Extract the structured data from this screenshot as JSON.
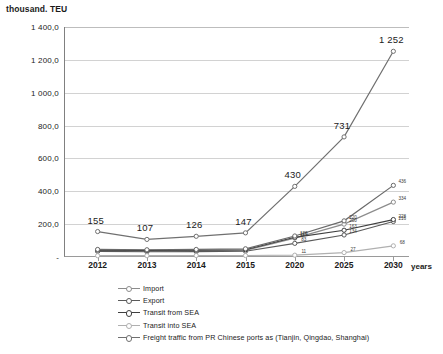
{
  "axes": {
    "y_title": "thousand. TEU",
    "x_title": "years",
    "y_ticks": [
      "1 400,0",
      "1 200,0",
      "1 000,0",
      "800,0",
      "600,0",
      "400,0",
      "200,0",
      "-"
    ],
    "x_ticks": [
      "2012",
      "2013",
      "2014",
      "2015",
      "2020",
      "2025",
      "2030"
    ]
  },
  "legend": {
    "items": [
      {
        "label": "Import",
        "color": "#8c8c8c"
      },
      {
        "label": "Export",
        "color": "#5a5a5a"
      },
      {
        "label": "Transit from SEA",
        "color": "#3f3f3f"
      },
      {
        "label": "Transit into SEA",
        "color": "#b0b0b0"
      },
      {
        "label": "Freight traffic from PR Chinese ports as (Tianjin, Qingdao, Shanghai)",
        "color": "#707070"
      }
    ]
  },
  "labels": {
    "freight": [
      "155",
      "107",
      "126",
      "147",
      "430",
      "731",
      "1 252"
    ],
    "y2020": [
      "120",
      "115",
      "83",
      "11"
    ],
    "y2025": [
      "220",
      "200",
      "163",
      "134",
      "27"
    ],
    "y2030": [
      "436",
      "334",
      "228",
      "216",
      "68"
    ],
    "y2015": [
      "25",
      "19"
    ]
  },
  "chart_data": {
    "type": "line",
    "title": "",
    "xlabel": "years",
    "ylabel": "thousand. TEU",
    "ylim": [
      0,
      1400
    ],
    "grid": true,
    "legend_position": "bottom-left",
    "categories": [
      "2012",
      "2013",
      "2014",
      "2015",
      "2020",
      "2025",
      "2030"
    ],
    "series": [
      {
        "name": "Import",
        "color": "#8c8c8c",
        "values": [
          38,
          36,
          37,
          40,
          115,
          200,
          334
        ],
        "labels": [
          "",
          "",
          "",
          "",
          "115",
          "200",
          "334"
        ]
      },
      {
        "name": "Export",
        "color": "#5a5a5a",
        "values": [
          34,
          32,
          33,
          35,
          83,
          134,
          216
        ],
        "labels": [
          "",
          "",
          "",
          "",
          "83",
          "134",
          "216"
        ]
      },
      {
        "name": "Transit from SEA",
        "color": "#3f3f3f",
        "values": [
          42,
          40,
          41,
          44,
          120,
          163,
          228
        ],
        "labels": [
          "",
          "",
          "",
          "",
          "120",
          "163",
          "228"
        ]
      },
      {
        "name": "Transit into SEA",
        "color": "#b0b0b0",
        "values": [
          8,
          8,
          9,
          9,
          11,
          27,
          68
        ],
        "labels": [
          "",
          "",
          "",
          "",
          "11",
          "27",
          "68"
        ]
      },
      {
        "name": "Freight traffic from PR Chinese ports as (Tianjin, Qingdao, Shanghai)",
        "color": "#707070",
        "values": [
          155,
          107,
          126,
          147,
          430,
          731,
          1252
        ],
        "labels": [
          "155",
          "107",
          "126",
          "147",
          "430",
          "731",
          "1 252"
        ]
      },
      {
        "name": "Upper growth series",
        "color": "#6a6a6a",
        "values": [
          46,
          44,
          46,
          50,
          128,
          220,
          436
        ],
        "labels": [
          "",
          "",
          "",
          "",
          "",
          "220",
          "436"
        ]
      }
    ]
  }
}
